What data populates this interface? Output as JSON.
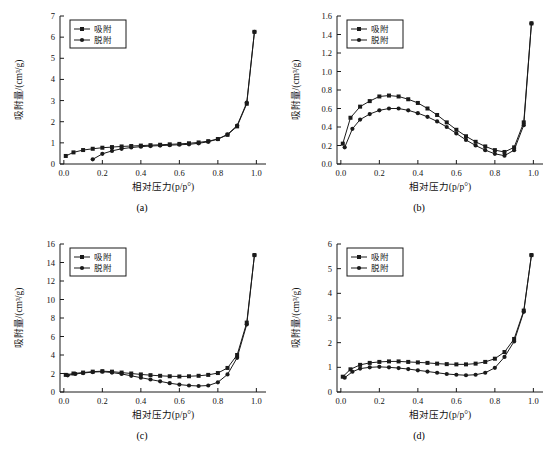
{
  "figure": {
    "caption": "",
    "panels": [
      {
        "key": "a",
        "label": "(a)",
        "xlabel": "相对压力(p/p°)",
        "ylabel": "吸附量/(cm³/g)",
        "legend": [
          "吸附",
          "脱附"
        ],
        "xticks": [
          "0.0",
          "0.2",
          "0.4",
          "0.6",
          "0.8",
          "1.0"
        ],
        "yticks": [
          "0",
          "1",
          "2",
          "3",
          "4",
          "5",
          "6",
          "7"
        ],
        "chart_data": {
          "type": "line",
          "title": "(a)",
          "xlabel": "相对压力(p/p°)",
          "ylabel": "吸附量/(cm³/g)",
          "xlim": [
            -0.02,
            1.05
          ],
          "ylim": [
            0,
            7
          ],
          "grid": false,
          "legend_position": "top-left",
          "series": [
            {
              "name": "吸附",
              "marker": "square",
              "x": [
                0.01,
                0.05,
                0.1,
                0.15,
                0.2,
                0.25,
                0.3,
                0.35,
                0.4,
                0.45,
                0.5,
                0.55,
                0.6,
                0.65,
                0.7,
                0.75,
                0.8,
                0.85,
                0.9,
                0.95,
                0.99
              ],
              "y": [
                0.38,
                0.55,
                0.66,
                0.72,
                0.77,
                0.8,
                0.83,
                0.85,
                0.87,
                0.89,
                0.91,
                0.93,
                0.95,
                0.98,
                1.02,
                1.08,
                1.18,
                1.38,
                1.78,
                2.85,
                6.25
              ]
            },
            {
              "name": "脱附",
              "marker": "circle",
              "x": [
                0.15,
                0.2,
                0.25,
                0.3,
                0.35,
                0.4,
                0.45,
                0.5,
                0.55,
                0.6,
                0.65,
                0.7,
                0.75,
                0.8,
                0.85,
                0.9,
                0.95,
                0.99
              ],
              "y": [
                0.22,
                0.48,
                0.62,
                0.72,
                0.78,
                0.82,
                0.85,
                0.87,
                0.89,
                0.91,
                0.93,
                0.98,
                1.05,
                1.18,
                1.4,
                1.82,
                2.9,
                6.25
              ]
            }
          ]
        }
      },
      {
        "key": "b",
        "label": "(b)",
        "xlabel": "相对压力(p/p°)",
        "ylabel": "吸附量/(cm³/g)",
        "legend": [
          "吸附",
          "脱附"
        ],
        "xticks": [
          "0.0",
          "0.2",
          "0.4",
          "0.6",
          "0.8",
          "1.0"
        ],
        "yticks": [
          "0.0",
          "0.2",
          "0.4",
          "0.6",
          "0.8",
          "1.0",
          "1.2",
          "1.4",
          "1.6"
        ],
        "chart_data": {
          "type": "line",
          "title": "(b)",
          "xlabel": "相对压力(p/p°)",
          "ylabel": "吸附量/(cm³/g)",
          "xlim": [
            -0.02,
            1.05
          ],
          "ylim": [
            0.0,
            1.6
          ],
          "grid": false,
          "legend_position": "top-left",
          "series": [
            {
              "name": "吸附",
              "marker": "square",
              "x": [
                0.01,
                0.05,
                0.1,
                0.15,
                0.2,
                0.25,
                0.3,
                0.35,
                0.4,
                0.45,
                0.5,
                0.55,
                0.6,
                0.65,
                0.7,
                0.75,
                0.8,
                0.85,
                0.9,
                0.95,
                0.99
              ],
              "y": [
                0.22,
                0.5,
                0.62,
                0.68,
                0.73,
                0.74,
                0.73,
                0.7,
                0.66,
                0.6,
                0.53,
                0.45,
                0.37,
                0.3,
                0.24,
                0.19,
                0.15,
                0.13,
                0.18,
                0.45,
                1.52
              ]
            },
            {
              "name": "脱附",
              "marker": "circle",
              "x": [
                0.02,
                0.06,
                0.1,
                0.15,
                0.2,
                0.25,
                0.3,
                0.35,
                0.4,
                0.45,
                0.5,
                0.55,
                0.6,
                0.65,
                0.7,
                0.75,
                0.8,
                0.85,
                0.9,
                0.95,
                0.99
              ],
              "y": [
                0.18,
                0.38,
                0.48,
                0.54,
                0.58,
                0.6,
                0.6,
                0.58,
                0.55,
                0.51,
                0.46,
                0.4,
                0.33,
                0.26,
                0.2,
                0.15,
                0.11,
                0.09,
                0.15,
                0.42,
                1.52
              ]
            }
          ]
        }
      },
      {
        "key": "c",
        "label": "(c)",
        "xlabel": "相对压力(p/p°)",
        "ylabel": "吸附量/(cm³/g)",
        "legend": [
          "吸附",
          "脱附"
        ],
        "xticks": [
          "0.0",
          "0.2",
          "0.4",
          "0.6",
          "0.8",
          "1.0"
        ],
        "yticks": [
          "0",
          "2",
          "4",
          "6",
          "8",
          "10",
          "12",
          "14",
          "16"
        ],
        "chart_data": {
          "type": "line",
          "title": "(c)",
          "xlabel": "相对压力(p/p°)",
          "ylabel": "吸附量/(cm³/g)",
          "xlim": [
            -0.02,
            1.05
          ],
          "ylim": [
            0,
            16
          ],
          "grid": false,
          "legend_position": "top-left",
          "series": [
            {
              "name": "吸附",
              "marker": "square",
              "x": [
                0.01,
                0.05,
                0.1,
                0.15,
                0.2,
                0.25,
                0.3,
                0.35,
                0.4,
                0.45,
                0.5,
                0.55,
                0.6,
                0.65,
                0.7,
                0.75,
                0.8,
                0.85,
                0.9,
                0.95,
                0.99
              ],
              "y": [
                1.85,
                2.0,
                2.1,
                2.2,
                2.25,
                2.2,
                2.1,
                2.0,
                1.9,
                1.82,
                1.75,
                1.7,
                1.68,
                1.7,
                1.75,
                1.85,
                2.05,
                2.6,
                4.0,
                7.5,
                14.8
              ]
            },
            {
              "name": "脱附",
              "marker": "circle",
              "x": [
                0.02,
                0.06,
                0.1,
                0.15,
                0.2,
                0.25,
                0.3,
                0.35,
                0.4,
                0.45,
                0.5,
                0.55,
                0.6,
                0.65,
                0.7,
                0.75,
                0.8,
                0.85,
                0.9,
                0.95,
                0.99
              ],
              "y": [
                1.8,
                1.95,
                2.05,
                2.15,
                2.2,
                2.1,
                1.95,
                1.75,
                1.55,
                1.35,
                1.15,
                0.95,
                0.8,
                0.7,
                0.65,
                0.7,
                1.05,
                1.9,
                3.7,
                7.3,
                14.8
              ]
            }
          ]
        }
      },
      {
        "key": "d",
        "label": "(d)",
        "xlabel": "相对压力(p/p°)",
        "ylabel": "吸附量/(cm³/g)",
        "legend": [
          "吸附",
          "脱附"
        ],
        "xticks": [
          "0.0",
          "0.2",
          "0.4",
          "0.6",
          "0.8",
          "1.0"
        ],
        "yticks": [
          "0",
          "1",
          "2",
          "3",
          "4",
          "5",
          "6"
        ],
        "chart_data": {
          "type": "line",
          "title": "(d)",
          "xlabel": "相对压力(p/p°)",
          "ylabel": "吸附量/(cm³/g)",
          "xlim": [
            -0.02,
            1.05
          ],
          "ylim": [
            0,
            6
          ],
          "grid": false,
          "legend_position": "top-left",
          "series": [
            {
              "name": "吸附",
              "marker": "square",
              "x": [
                0.01,
                0.05,
                0.1,
                0.15,
                0.2,
                0.25,
                0.3,
                0.35,
                0.4,
                0.45,
                0.5,
                0.55,
                0.6,
                0.65,
                0.7,
                0.75,
                0.8,
                0.85,
                0.9,
                0.95,
                0.99
              ],
              "y": [
                0.62,
                0.92,
                1.1,
                1.18,
                1.22,
                1.24,
                1.24,
                1.22,
                1.2,
                1.18,
                1.15,
                1.13,
                1.12,
                1.12,
                1.15,
                1.22,
                1.35,
                1.62,
                2.15,
                3.3,
                5.55
              ]
            },
            {
              "name": "脱附",
              "marker": "circle",
              "x": [
                0.02,
                0.06,
                0.1,
                0.15,
                0.2,
                0.25,
                0.3,
                0.35,
                0.4,
                0.45,
                0.5,
                0.55,
                0.6,
                0.65,
                0.7,
                0.75,
                0.8,
                0.85,
                0.9,
                0.95,
                0.99
              ],
              "y": [
                0.58,
                0.82,
                0.95,
                1.0,
                1.02,
                1.0,
                0.97,
                0.93,
                0.88,
                0.83,
                0.78,
                0.73,
                0.7,
                0.68,
                0.7,
                0.78,
                0.98,
                1.42,
                2.05,
                3.25,
                5.55
              ]
            }
          ]
        }
      }
    ]
  }
}
